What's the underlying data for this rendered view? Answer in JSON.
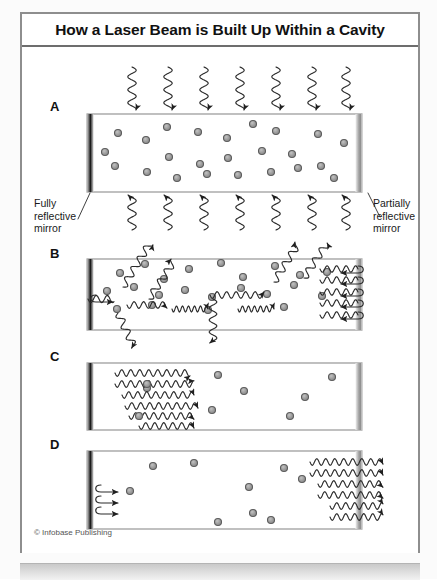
{
  "figure": {
    "title": "How a Laser Beam is Built Up Within a Cavity",
    "credit": "© Infobase Publishing",
    "panels": [
      {
        "letter": "A",
        "name": "pumping",
        "caption_left": "Fully\nreflective\nmirror",
        "caption_right": "Partially\nreflective\nmirror"
      },
      {
        "letter": "B",
        "name": "spontaneous-and-stimulated-emission"
      },
      {
        "letter": "C",
        "name": "coherent-amplification"
      },
      {
        "letter": "D",
        "name": "beam-output"
      }
    ],
    "labels": {
      "fully_reflective_mirror": "Fully\nreflective\nmirror",
      "partially_reflective_mirror": "Partially\nreflective\nmirror",
      "fully_line1": "Fully",
      "fully_line2": "reflective",
      "fully_line3": "mirror",
      "partially_line1": "Partially",
      "partially_line2": "reflective",
      "partially_line3": "mirror"
    }
  },
  "chart_data": {
    "type": "diagram",
    "title": "How a Laser Beam is Built Up Within a Cavity",
    "panels": [
      {
        "id": "A",
        "stage": "Optical pumping",
        "atoms": 24,
        "waves_in_top": 7,
        "waves_out_bottom": 7,
        "wave_direction": "downward into cavity and downward out",
        "note": "Pump energy enters the lasing medium; atoms become excited."
      },
      {
        "id": "B",
        "stage": "Spontaneous and stimulated emission",
        "atoms": 22,
        "waves_random": 9,
        "waves_axial": 10,
        "note": "Photons emitted in random directions escape; axial photons reflect between mirrors."
      },
      {
        "id": "C",
        "stage": "Amplification along the cavity axis",
        "atoms": 7,
        "waves_axial": 6,
        "note": "Coherent in-phase waves travel rightward and grow in number."
      },
      {
        "id": "D",
        "stage": "Output beam",
        "atoms": 9,
        "waves_output": 6,
        "reflection_arrows": 3,
        "note": "The amplified beam passes through the partially reflective mirror as the laser output."
      }
    ],
    "colors": {
      "frame": "#8e8e8e",
      "title_rule": "#6d6d6d",
      "cavity_outline": "#8c8c8c",
      "atom_fill": "#9a9a9a",
      "atom_stroke": "#5c5c5c",
      "wave_stroke": "#2b2b2b",
      "mirror_full": "#1c1c1c",
      "mirror_partial": "#a8a8a8",
      "background": "#ffffff"
    }
  }
}
